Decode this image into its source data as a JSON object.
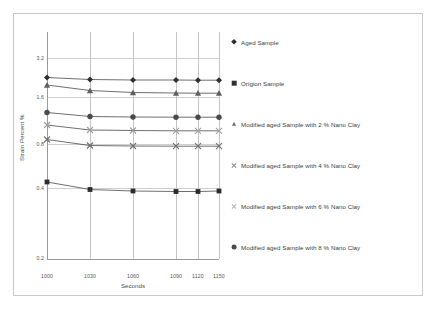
{
  "chart_data": {
    "type": "line",
    "title": "",
    "xlabel": "Seconds",
    "ylabel": "Strain Percent  %",
    "x": [
      1000,
      1030,
      1060,
      1090,
      1120,
      1150
    ],
    "xtick_labels": [
      "1000",
      "1030",
      "1060",
      "1090",
      "1120",
      "1150"
    ],
    "ytick_labels": [
      "3.2",
      "1.6",
      "0.8",
      "0.4",
      "0.2"
    ],
    "ytick_px": [
      58,
      97,
      144,
      188,
      258
    ],
    "xtick_px": [
      47,
      90,
      133,
      176,
      198,
      219
    ],
    "grid": "horizontal and vertical gridlines",
    "legend_position": "right",
    "series": [
      {
        "name": "Aged Sample",
        "marker": "diamond",
        "values": [
          2.02,
          1.99,
          1.98,
          1.98,
          1.98,
          1.98
        ],
        "px_y": [
          77.5,
          79.5,
          80.0,
          80.0,
          80.2,
          80.2
        ]
      },
      {
        "name": "Origion Sample",
        "marker": "square",
        "values": [
          0.63,
          0.57,
          0.56,
          0.555,
          0.555,
          0.56
        ],
        "px_y": [
          182.0,
          189.5,
          191.0,
          191.5,
          191.5,
          191.0
        ]
      },
      {
        "name": "Modified aged Sample with 2 % Nano Clay",
        "marker": "triangle",
        "values": [
          1.9,
          1.83,
          1.81,
          1.8,
          1.8,
          1.8
        ],
        "px_y": [
          85.0,
          90.5,
          92.5,
          93.0,
          93.2,
          93.2
        ]
      },
      {
        "name": "Modified aged Sample with 4 % Nano Clay",
        "marker": "cross",
        "values": [
          0.855,
          0.805,
          0.8,
          0.8,
          0.8,
          0.8
        ],
        "px_y": [
          139.5,
          145.5,
          146.0,
          146.2,
          146.2,
          146.2
        ]
      },
      {
        "name": "Modified aged Sample with 6 % Nano Clay",
        "marker": "cross-light",
        "values": [
          1.07,
          1.015,
          1.01,
          1.01,
          1.01,
          1.01
        ],
        "px_y": [
          125.0,
          130.0,
          130.5,
          130.8,
          130.8,
          130.8
        ]
      },
      {
        "name": "Modified aged Sample with 8 % Nano Clay",
        "marker": "circle",
        "values": [
          1.43,
          1.38,
          1.375,
          1.375,
          1.375,
          1.375
        ],
        "px_y": [
          112.5,
          116.5,
          117.0,
          117.2,
          117.2,
          117.2
        ]
      }
    ]
  },
  "axes": {
    "xlabel": "Seconds",
    "ylabel": "Strain Percent  %",
    "ytick_0": "3.2",
    "ytick_1": "1.6",
    "ytick_2": "0.8",
    "ytick_3": "0.4",
    "ytick_4": "0.2",
    "xtick_0": "1000",
    "xtick_1": "1030",
    "xtick_2": "1060",
    "xtick_3": "1090",
    "xtick_4": "1120",
    "xtick_5": "1150"
  },
  "legend": {
    "items": [
      {
        "label": "Aged Sample",
        "marker": "diamond-icon"
      },
      {
        "label": "Origion Sample",
        "marker": "square-icon"
      },
      {
        "label": "Modified aged Sample with 2 % Nano Clay",
        "marker": "triangle-icon"
      },
      {
        "label": "Modified aged Sample with 4 % Nano Clay",
        "marker": "cross-icon"
      },
      {
        "label": "Modified aged Sample with 6 % Nano Clay",
        "marker": "cross-light-icon"
      },
      {
        "label": "Modified aged Sample with 8 % Nano Clay",
        "marker": "circle-icon"
      }
    ]
  },
  "colors": {
    "line": "#4a4a4a",
    "grid": "#cfcfcf",
    "axis": "#9a9a9a",
    "text": "#3d3d3d",
    "frame": "#c8c8c8"
  }
}
